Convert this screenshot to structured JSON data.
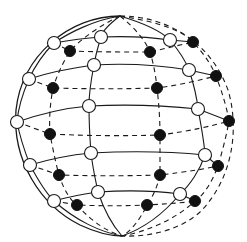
{
  "diagram": {
    "title": "",
    "type": "sphere-lattice",
    "colors": {
      "line": "#1a1a1a",
      "open_node_fill": "#ffffff",
      "filled_node_fill": "#111111",
      "background": "#ffffff"
    },
    "nodes": {
      "open": [
        [
          54,
          43
        ],
        [
          101,
          37
        ],
        [
          170,
          40
        ],
        [
          29,
          79
        ],
        [
          94,
          65
        ],
        [
          189,
          70
        ],
        [
          17,
          122
        ],
        [
          89,
          106
        ],
        [
          198,
          109
        ],
        [
          30,
          165
        ],
        [
          91,
          153
        ],
        [
          205,
          155
        ],
        [
          54,
          201
        ],
        [
          98,
          192
        ],
        [
          180,
          194
        ]
      ],
      "filled": [
        [
          70,
          51
        ],
        [
          150,
          52
        ],
        [
          193,
          42
        ],
        [
          53,
          88
        ],
        [
          157,
          88
        ],
        [
          216,
          76
        ],
        [
          50,
          134
        ],
        [
          160,
          135
        ],
        [
          229,
          121
        ],
        [
          59,
          175
        ],
        [
          160,
          175
        ],
        [
          218,
          166
        ],
        [
          77,
          205
        ],
        [
          147,
          205
        ],
        [
          195,
          201
        ]
      ]
    }
  }
}
